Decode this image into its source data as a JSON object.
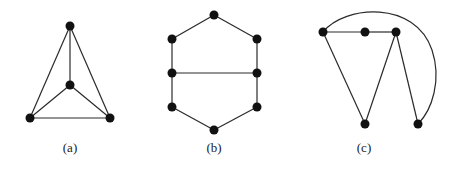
{
  "figure": {
    "panels": [
      {
        "id": "a",
        "caption": "(a)",
        "caption_pos": [
          70,
          152
        ],
        "nodes": [
          {
            "id": "a1",
            "x": 70,
            "y": 26
          },
          {
            "id": "a2",
            "x": 70,
            "y": 85
          },
          {
            "id": "a3",
            "x": 30,
            "y": 118
          },
          {
            "id": "a4",
            "x": 110,
            "y": 118
          }
        ],
        "edges": [
          [
            "a1",
            "a2"
          ],
          [
            "a1",
            "a3"
          ],
          [
            "a1",
            "a4"
          ],
          [
            "a2",
            "a3"
          ],
          [
            "a2",
            "a4"
          ],
          [
            "a3",
            "a4"
          ]
        ]
      },
      {
        "id": "b",
        "caption": "(b)",
        "caption_pos": [
          214,
          152
        ],
        "nodes": [
          {
            "id": "b1",
            "x": 214,
            "y": 15
          },
          {
            "id": "b2",
            "x": 172,
            "y": 39
          },
          {
            "id": "b3",
            "x": 257,
            "y": 39
          },
          {
            "id": "b4",
            "x": 172,
            "y": 73
          },
          {
            "id": "b5",
            "x": 257,
            "y": 73
          },
          {
            "id": "b6",
            "x": 172,
            "y": 107
          },
          {
            "id": "b7",
            "x": 257,
            "y": 107
          },
          {
            "id": "b8",
            "x": 214,
            "y": 130
          }
        ],
        "edges": [
          [
            "b1",
            "b2"
          ],
          [
            "b1",
            "b3"
          ],
          [
            "b2",
            "b4"
          ],
          [
            "b3",
            "b5"
          ],
          [
            "b4",
            "b5"
          ],
          [
            "b4",
            "b6"
          ],
          [
            "b5",
            "b7"
          ],
          [
            "b6",
            "b8"
          ],
          [
            "b7",
            "b8"
          ]
        ]
      },
      {
        "id": "c",
        "caption": "(c)",
        "caption_pos": [
          364,
          152
        ],
        "nodes": [
          {
            "id": "c1",
            "x": 323,
            "y": 32
          },
          {
            "id": "c2",
            "x": 365,
            "y": 32
          },
          {
            "id": "c3",
            "x": 396,
            "y": 32
          },
          {
            "id": "c4",
            "x": 365,
            "y": 124
          },
          {
            "id": "c5",
            "x": 418,
            "y": 124
          }
        ],
        "edges": [
          [
            "c1",
            "c2"
          ],
          [
            "c2",
            "c3"
          ],
          [
            "c1",
            "c4"
          ],
          [
            "c3",
            "c4"
          ],
          [
            "c3",
            "c5"
          ]
        ],
        "curved_edges": [
          {
            "from": "c1",
            "to": "c5",
            "path": "M323,32 C345,5 415,0 432,50 C442,80 432,110 418,124"
          }
        ]
      }
    ],
    "style": {
      "node_radius": 4.5,
      "node_color": "#111111",
      "edge_color": "#2a2a2a",
      "background": "#ffffff"
    }
  }
}
